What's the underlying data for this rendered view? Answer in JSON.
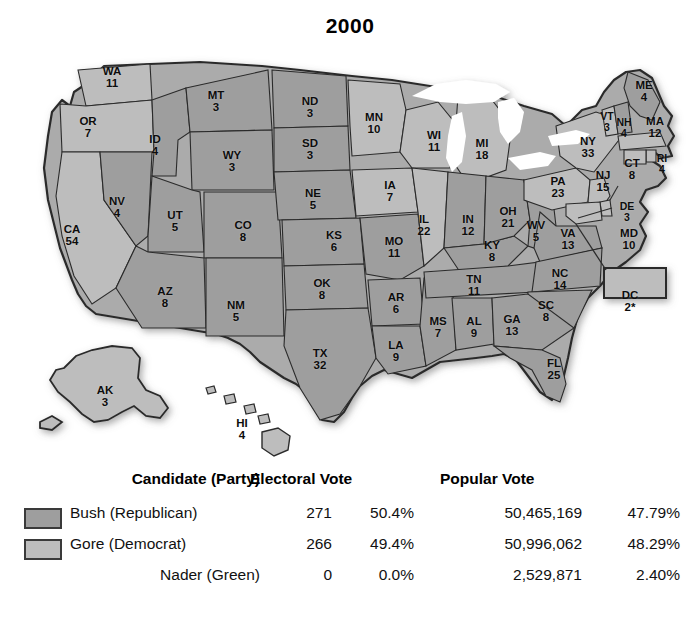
{
  "title": "2000",
  "colors": {
    "bush": "#9e9e9e",
    "gore": "#bdbdbd",
    "outline": "#2b2b2b",
    "water": "#ffffff",
    "background": "#ffffff"
  },
  "map": {
    "name": "united-states-electoral-map-2000",
    "states": [
      {
        "ab": "WA",
        "ev": "11",
        "party": "gore",
        "x": 112,
        "y": 38
      },
      {
        "ab": "OR",
        "ev": "7",
        "party": "gore",
        "x": 88,
        "y": 88
      },
      {
        "ab": "CA",
        "ev": "54",
        "party": "gore",
        "x": 72,
        "y": 196
      },
      {
        "ab": "NV",
        "ev": "4",
        "party": "bush",
        "x": 117,
        "y": 168
      },
      {
        "ab": "ID",
        "ev": "4",
        "party": "bush",
        "x": 155,
        "y": 106
      },
      {
        "ab": "MT",
        "ev": "3",
        "party": "bush",
        "x": 216,
        "y": 62
      },
      {
        "ab": "WY",
        "ev": "3",
        "party": "bush",
        "x": 232,
        "y": 122
      },
      {
        "ab": "UT",
        "ev": "5",
        "party": "bush",
        "x": 175,
        "y": 182
      },
      {
        "ab": "CO",
        "ev": "8",
        "party": "bush",
        "x": 243,
        "y": 192
      },
      {
        "ab": "AZ",
        "ev": "8",
        "party": "bush",
        "x": 165,
        "y": 258
      },
      {
        "ab": "NM",
        "ev": "5",
        "party": "bush",
        "x": 236,
        "y": 272
      },
      {
        "ab": "ND",
        "ev": "3",
        "party": "bush",
        "x": 310,
        "y": 68
      },
      {
        "ab": "SD",
        "ev": "3",
        "party": "bush",
        "x": 310,
        "y": 110
      },
      {
        "ab": "NE",
        "ev": "5",
        "party": "bush",
        "x": 313,
        "y": 160
      },
      {
        "ab": "KS",
        "ev": "6",
        "party": "bush",
        "x": 334,
        "y": 202
      },
      {
        "ab": "OK",
        "ev": "8",
        "party": "bush",
        "x": 322,
        "y": 250
      },
      {
        "ab": "TX",
        "ev": "32",
        "party": "bush",
        "x": 320,
        "y": 320
      },
      {
        "ab": "MN",
        "ev": "10",
        "party": "gore",
        "x": 374,
        "y": 84
      },
      {
        "ab": "IA",
        "ev": "7",
        "party": "gore",
        "x": 390,
        "y": 152
      },
      {
        "ab": "MO",
        "ev": "11",
        "party": "bush",
        "x": 394,
        "y": 208
      },
      {
        "ab": "AR",
        "ev": "6",
        "party": "bush",
        "x": 396,
        "y": 264
      },
      {
        "ab": "LA",
        "ev": "9",
        "party": "bush",
        "x": 396,
        "y": 312
      },
      {
        "ab": "WI",
        "ev": "11",
        "party": "gore",
        "x": 434,
        "y": 102
      },
      {
        "ab": "IL",
        "ev": "22",
        "party": "gore",
        "x": 424,
        "y": 186
      },
      {
        "ab": "MS",
        "ev": "7",
        "party": "bush",
        "x": 438,
        "y": 288
      },
      {
        "ab": "MI",
        "ev": "18",
        "party": "gore",
        "x": 482,
        "y": 110
      },
      {
        "ab": "IN",
        "ev": "12",
        "party": "bush",
        "x": 468,
        "y": 186
      },
      {
        "ab": "KY",
        "ev": "8",
        "party": "bush",
        "x": 492,
        "y": 212
      },
      {
        "ab": "TN",
        "ev": "11",
        "party": "bush",
        "x": 474,
        "y": 246
      },
      {
        "ab": "AL",
        "ev": "9",
        "party": "bush",
        "x": 474,
        "y": 288
      },
      {
        "ab": "OH",
        "ev": "21",
        "party": "bush",
        "x": 508,
        "y": 178
      },
      {
        "ab": "WV",
        "ev": "5",
        "party": "bush",
        "x": 536,
        "y": 192
      },
      {
        "ab": "VA",
        "ev": "13",
        "party": "bush",
        "x": 568,
        "y": 200
      },
      {
        "ab": "NC",
        "ev": "14",
        "party": "bush",
        "x": 560,
        "y": 240
      },
      {
        "ab": "SC",
        "ev": "8",
        "party": "bush",
        "x": 546,
        "y": 272
      },
      {
        "ab": "GA",
        "ev": "13",
        "party": "bush",
        "x": 512,
        "y": 286
      },
      {
        "ab": "FL",
        "ev": "25",
        "party": "bush",
        "x": 554,
        "y": 330
      },
      {
        "ab": "PA",
        "ev": "23",
        "party": "gore",
        "x": 558,
        "y": 148
      },
      {
        "ab": "NY",
        "ev": "33",
        "party": "gore",
        "x": 588,
        "y": 108
      },
      {
        "ab": "ME",
        "ev": "4",
        "party": "bush",
        "x": 644,
        "y": 52
      },
      {
        "ab": "VT",
        "ev": "3",
        "party": "gore",
        "x": 607,
        "y": 82
      },
      {
        "ab": "NH",
        "ev": "4",
        "party": "bush",
        "x": 624,
        "y": 88
      },
      {
        "ab": "MA",
        "ev": "12",
        "party": "gore",
        "x": 655,
        "y": 88
      },
      {
        "ab": "RI",
        "ev": "4",
        "party": "gore",
        "x": 662,
        "y": 124
      },
      {
        "ab": "CT",
        "ev": "8",
        "party": "gore",
        "x": 632,
        "y": 130
      },
      {
        "ab": "NJ",
        "ev": "15",
        "party": "gore",
        "x": 603,
        "y": 142
      },
      {
        "ab": "DE",
        "ev": "3",
        "party": "gore",
        "x": 627,
        "y": 172
      },
      {
        "ab": "MD",
        "ev": "10",
        "party": "gore",
        "x": 629,
        "y": 200
      },
      {
        "ab": "DC",
        "ev": "2*",
        "party": "gore",
        "x": 630,
        "y": 262
      },
      {
        "ab": "AK",
        "ev": "3",
        "party": "gore",
        "x": 105,
        "y": 357
      },
      {
        "ab": "HI",
        "ev": "4",
        "party": "gore",
        "x": 242,
        "y": 390
      }
    ]
  },
  "legend": {
    "headers": {
      "candidate": "Candidate (Party)",
      "electoral": "Electoral Vote",
      "popular": "Popular Vote"
    },
    "rows": [
      {
        "candidate": "Bush (Republican)",
        "swatch": "bush",
        "electoral_votes": "271",
        "electoral_pct": "50.4%",
        "popular_votes": "50,465,169",
        "popular_pct": "47.79%"
      },
      {
        "candidate": "Gore (Democrat)",
        "swatch": "gore",
        "electoral_votes": "266",
        "electoral_pct": "49.4%",
        "popular_votes": "50,996,062",
        "popular_pct": "48.29%"
      },
      {
        "candidate": "Nader (Green)",
        "swatch": null,
        "electoral_votes": "0",
        "electoral_pct": "0.0%",
        "popular_votes": "2,529,871",
        "popular_pct": "2.40%"
      }
    ],
    "footnote": "* One elector from the District of Columbia abstained."
  }
}
